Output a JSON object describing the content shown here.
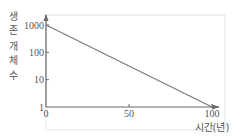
{
  "chart_data": {
    "type": "line",
    "title": "",
    "xlabel": "시간(년)",
    "ylabel": "생존 개체 수",
    "ylabel_chars": [
      "생",
      "존",
      "개",
      "체",
      "수"
    ],
    "yscale": "log",
    "xlim": [
      0,
      100
    ],
    "ylim": [
      1,
      1000
    ],
    "x_ticks": [
      0,
      50,
      100
    ],
    "x_tick_labels": [
      "0",
      "50",
      "100"
    ],
    "y_ticks": [
      1,
      10,
      100,
      1000
    ],
    "y_tick_labels": [
      "1",
      "10",
      "100",
      "1000"
    ],
    "grid": false,
    "legend": "none",
    "series": [
      {
        "name": "survivors",
        "x": [
          0,
          100
        ],
        "y": [
          1000,
          1
        ]
      }
    ],
    "colors": {
      "line": "#7a7a7a",
      "axis": "#6a6a6a",
      "frame": "#e4e4e4"
    }
  }
}
